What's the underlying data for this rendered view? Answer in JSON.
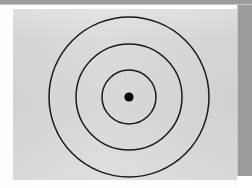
{
  "figure": {
    "description": "Three concentric circles with a filled dot at the common centre, drawn on a plain light-grey field.",
    "panel_color": "#d9d9d9",
    "paper_color": "#fdfdfd",
    "frame_edge_color": "#9b9b9b",
    "stroke_color": "#1a1a1a",
    "dot_color": "#000000"
  },
  "chart_data": {
    "type": "scatter",
    "xlabel": "",
    "ylabel": "",
    "center": {
      "x": 116,
      "y": 88
    },
    "rings": [
      {
        "name": "outer-ring",
        "radius": 80,
        "stroke_width": 1.5
      },
      {
        "name": "middle-ring",
        "radius": 53,
        "stroke_width": 1.5
      },
      {
        "name": "inner-ring",
        "radius": 27,
        "stroke_width": 1.5
      },
      {
        "name": "center-dot",
        "radius": 4.6,
        "filled": true
      }
    ]
  },
  "labels": {
    "center_dot": "center point",
    "inner_ring": "inner circle",
    "middle_ring": "middle circle",
    "outer_ring": "outer circle"
  }
}
